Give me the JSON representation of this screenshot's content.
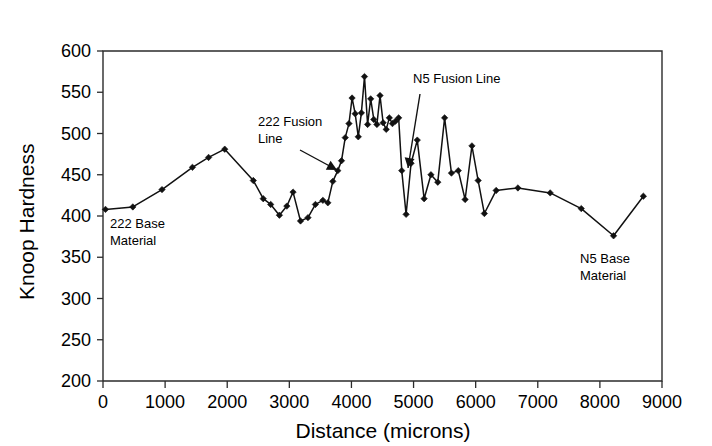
{
  "chart_data": {
    "type": "line",
    "title": "",
    "xlabel": "Distance (microns)",
    "ylabel": "Knoop Hardness",
    "xlim": [
      0,
      9000
    ],
    "ylim": [
      200,
      600
    ],
    "xticks": [
      0,
      1000,
      2000,
      3000,
      4000,
      5000,
      6000,
      7000,
      8000,
      9000
    ],
    "yticks": [
      200,
      250,
      300,
      350,
      400,
      450,
      500,
      550,
      600
    ],
    "grid": false,
    "legend": "none",
    "marker": "filled-diamond",
    "line_color": "#111111",
    "series": [
      {
        "name": "Knoop hardness traverse",
        "x": [
          40,
          480,
          950,
          1440,
          1700,
          1960,
          2420,
          2580,
          2700,
          2840,
          2960,
          3060,
          3180,
          3300,
          3420,
          3540,
          3620,
          3700,
          3780,
          3840,
          3900,
          3960,
          4010,
          4060,
          4110,
          4160,
          4210,
          4260,
          4310,
          4360,
          4410,
          4460,
          4510,
          4560,
          4610,
          4660,
          4710,
          4760,
          4810,
          4880,
          4960,
          5060,
          5170,
          5280,
          5390,
          5500,
          5610,
          5720,
          5830,
          5940,
          6040,
          6140,
          6330,
          6680,
          7200,
          7700,
          8220,
          8700
        ],
        "y": [
          408,
          411,
          432,
          459,
          471,
          481,
          443,
          421,
          414,
          401,
          412,
          429,
          394,
          398,
          414,
          419,
          416,
          442,
          455,
          467,
          495,
          512,
          543,
          524,
          496,
          525,
          569,
          511,
          542,
          517,
          511,
          546,
          513,
          505,
          519,
          512,
          515,
          519,
          455,
          402,
          464,
          492,
          421,
          450,
          441,
          519,
          452,
          455,
          420,
          485,
          443,
          403,
          431,
          434,
          428,
          409,
          376,
          424
        ]
      }
    ],
    "annotations": [
      {
        "id": "ann-222-base",
        "text_line1": "222 Base",
        "text_line2": "Material",
        "x_px": 110,
        "y_px": 228
      },
      {
        "id": "ann-222-fusion",
        "text_line1": "222 Fusion",
        "text_line2": "Line",
        "x_px": 258,
        "y_px": 126,
        "arrow_from_x": 300,
        "arrow_from_y": 150,
        "arrow_to_x": 337,
        "arrow_to_y": 170
      },
      {
        "id": "ann-n5-fusion",
        "text_line1": "N5 Fusion Line",
        "text_line2": "",
        "x_px": 413,
        "y_px": 83,
        "arrow_from_x": 420,
        "arrow_from_y": 94,
        "arrow_to_x": 408,
        "arrow_to_y": 168
      },
      {
        "id": "ann-n5-base",
        "text_line1": "N5 Base",
        "text_line2": "Material",
        "x_px": 580,
        "y_px": 263
      }
    ]
  },
  "axes": {
    "y_title": "Knoop Hardness",
    "x_title": "Distance (microns)"
  }
}
